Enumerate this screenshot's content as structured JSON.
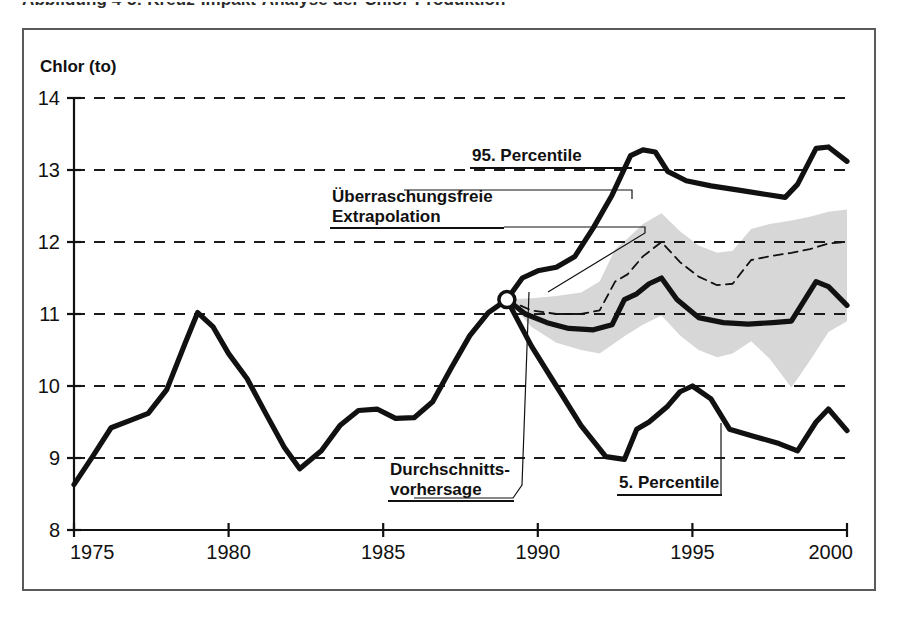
{
  "figure": {
    "title": "Abbildung 4-5: Kreuz-Impakt-Analyse der Chlor-Produktion"
  },
  "colors": {
    "band_fill": "#d7d7d7",
    "line_main": "#111111",
    "frame": "#5a5a5a",
    "grid": "#1a1a1a",
    "background": "#ffffff"
  },
  "chart_data": {
    "type": "line",
    "title": "",
    "xlabel": "",
    "ylabel": "Chlor (to)",
    "xlim": [
      1975,
      2000
    ],
    "ylim": [
      8,
      14
    ],
    "xticks": [
      1975,
      1980,
      1985,
      1990,
      1995,
      2000
    ],
    "yticks": [
      8,
      9,
      10,
      11,
      12,
      13,
      14
    ],
    "grid": "horizontal-dashed",
    "legend": "annotations-inline",
    "annotations": [
      {
        "name": "p95",
        "label": "95. Percentile"
      },
      {
        "name": "extrapolation",
        "label": "Überraschungsfreie\nExtrapolation"
      },
      {
        "name": "mean",
        "label": "Durchschnitts-\nvorhersage"
      },
      {
        "name": "p05",
        "label": "5. Percentile"
      }
    ],
    "fork_point": {
      "x": 1989,
      "y": 11.2
    },
    "series": [
      {
        "name": "Historie",
        "style": "thick-solid",
        "x": [
          1975,
          1975.6,
          1976.2,
          1976.8,
          1977.4,
          1978,
          1978.6,
          1979,
          1979.5,
          1980,
          1980.6,
          1981.2,
          1981.8,
          1982.3,
          1983,
          1983.6,
          1984.2,
          1984.8,
          1985.4,
          1986,
          1986.6,
          1987.2,
          1987.8,
          1988.4,
          1989
        ],
        "values": [
          8.63,
          9.02,
          9.42,
          9.52,
          9.62,
          9.95,
          10.6,
          11.02,
          10.82,
          10.45,
          10.1,
          9.62,
          9.15,
          8.85,
          9.1,
          9.45,
          9.66,
          9.68,
          9.55,
          9.56,
          9.78,
          10.25,
          10.7,
          11.02,
          11.2
        ]
      },
      {
        "name": "95. Percentile",
        "style": "thick-solid",
        "x": [
          1989,
          1989.5,
          1990,
          1990.6,
          1991.2,
          1991.8,
          1992.4,
          1993,
          1993.4,
          1993.8,
          1994.2,
          1994.8,
          1995.6,
          1996.5,
          1997.4,
          1998,
          1998.4,
          1999,
          1999.4,
          2000
        ],
        "values": [
          11.2,
          11.5,
          11.6,
          11.65,
          11.8,
          12.2,
          12.65,
          13.2,
          13.28,
          13.25,
          12.98,
          12.85,
          12.78,
          12.72,
          12.66,
          12.62,
          12.8,
          13.3,
          13.32,
          13.12
        ]
      },
      {
        "name": "Durchschnittsvorhersage",
        "style": "thick-solid",
        "x": [
          1989,
          1989.6,
          1990.3,
          1991,
          1991.8,
          1992.4,
          1992.8,
          1993.2,
          1993.6,
          1994,
          1994.5,
          1995.2,
          1996,
          1996.8,
          1997.6,
          1998.2,
          1999,
          1999.4,
          2000
        ],
        "values": [
          11.2,
          11.0,
          10.88,
          10.8,
          10.78,
          10.85,
          11.2,
          11.28,
          11.42,
          11.5,
          11.2,
          10.95,
          10.88,
          10.86,
          10.88,
          10.9,
          11.45,
          11.38,
          11.12
        ]
      },
      {
        "name": "5. Percentile",
        "style": "thick-solid",
        "x": [
          1989,
          1989.8,
          1990.6,
          1991.4,
          1992.2,
          1992.8,
          1993.2,
          1993.6,
          1994.2,
          1994.6,
          1995,
          1995.6,
          1996.2,
          1997,
          1997.8,
          1998.4,
          1999,
          1999.4,
          2000
        ],
        "values": [
          11.2,
          10.55,
          10.0,
          9.45,
          9.02,
          8.98,
          9.4,
          9.5,
          9.72,
          9.92,
          10.0,
          9.82,
          9.4,
          9.3,
          9.2,
          9.1,
          9.5,
          9.68,
          9.38
        ]
      },
      {
        "name": "Überraschungsfreie Extrapolation",
        "style": "thin-dashed",
        "x": [
          1989,
          1989.8,
          1990.6,
          1991.4,
          1992,
          1992.5,
          1992.9,
          1993.4,
          1994,
          1994.6,
          1995.2,
          1995.8,
          1996.3,
          1996.9,
          1997.5,
          1998.2,
          1998.8,
          1999.4,
          2000
        ],
        "values": [
          11.2,
          11.05,
          11.0,
          11.0,
          11.05,
          11.45,
          11.55,
          11.8,
          12.0,
          11.72,
          11.52,
          11.4,
          11.42,
          11.75,
          11.8,
          11.85,
          11.9,
          11.98,
          12.0
        ]
      }
    ],
    "band": {
      "name": "Unsicherheitsband",
      "fill": "#d7d7d7",
      "x": [
        1989,
        1989.8,
        1990.6,
        1991.4,
        1992,
        1992.5,
        1992.9,
        1993.4,
        1994,
        1994.6,
        1995.2,
        1995.8,
        1996.3,
        1996.9,
        1997.5,
        1998.2,
        1998.8,
        1999.4,
        2000
      ],
      "upper": [
        11.2,
        11.22,
        11.25,
        11.3,
        11.45,
        11.9,
        12.05,
        12.25,
        12.4,
        12.15,
        11.95,
        11.85,
        11.88,
        12.18,
        12.25,
        12.3,
        12.35,
        12.42,
        12.45
      ],
      "lower": [
        11.2,
        10.82,
        10.6,
        10.5,
        10.45,
        10.6,
        10.72,
        10.85,
        10.98,
        10.7,
        10.5,
        10.4,
        10.45,
        10.62,
        10.38,
        9.98,
        10.35,
        10.75,
        10.9
      ]
    }
  }
}
